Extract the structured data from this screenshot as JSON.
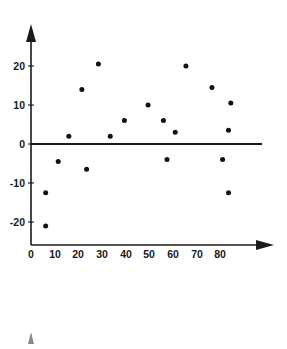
{
  "figure": {
    "title": "",
    "background_color": "#ffffff",
    "point_color": "#111111",
    "axis_color": "#1a1a1a"
  },
  "chart_data": {
    "type": "scatter",
    "title": "",
    "subtitle": "",
    "xlabel": "",
    "ylabel": "",
    "xlim": [
      0,
      88
    ],
    "ylim": [
      -24,
      25
    ],
    "grid": false,
    "legend": null,
    "x_ticks": [
      0,
      10,
      20,
      30,
      40,
      50,
      60,
      70,
      80
    ],
    "x_tick_labels": [
      "0",
      "10",
      "20",
      "30",
      "40",
      "50",
      "60",
      "70",
      "80"
    ],
    "y_ticks": [
      -20,
      -10,
      0,
      10,
      20
    ],
    "y_tick_labels": [
      "-20",
      "-10",
      "0",
      "10",
      "20"
    ],
    "reference_line": {
      "orientation": "horizontal",
      "value": 0
    },
    "series": [
      {
        "name": "residuals",
        "marker": "circle",
        "color": "#111111",
        "points": [
          {
            "x": 6.2,
            "y": -12.5
          },
          {
            "x": 6.2,
            "y": -21.0
          },
          {
            "x": 11.5,
            "y": -4.5
          },
          {
            "x": 16.0,
            "y": 2.0
          },
          {
            "x": 21.5,
            "y": 14.0
          },
          {
            "x": 23.5,
            "y": -6.5
          },
          {
            "x": 28.5,
            "y": 20.5
          },
          {
            "x": 33.5,
            "y": 2.0
          },
          {
            "x": 39.5,
            "y": 6.0
          },
          {
            "x": 49.5,
            "y": 10.0
          },
          {
            "x": 56.0,
            "y": 6.0
          },
          {
            "x": 57.5,
            "y": -4.0
          },
          {
            "x": 61.0,
            "y": 3.0
          },
          {
            "x": 65.5,
            "y": 20.0
          },
          {
            "x": 76.5,
            "y": 14.5
          },
          {
            "x": 81.0,
            "y": -4.0
          },
          {
            "x": 83.5,
            "y": 3.5
          },
          {
            "x": 83.5,
            "y": -12.5
          },
          {
            "x": 84.5,
            "y": 10.5
          }
        ]
      }
    ]
  },
  "secondary_axis": {
    "present": true,
    "description": "top of a second plot axis partially visible at bottom edge"
  }
}
